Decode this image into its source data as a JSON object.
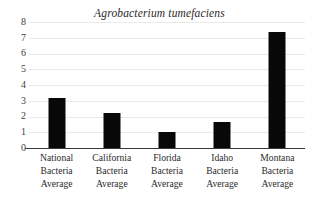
{
  "chart_data": {
    "type": "bar",
    "title": "Agrobacterium tumefaciens",
    "xlabel": "",
    "ylabel": "",
    "ylim": [
      0,
      8
    ],
    "yticks": [
      0,
      1,
      2,
      3,
      4,
      5,
      6,
      7,
      8
    ],
    "grid": true,
    "legend": false,
    "bar_color": "#080808",
    "gridline_color": "#e9e9e9",
    "axis_color": "#3a3a3a",
    "categories": [
      "National Bacteria Average",
      "California Bacteria Average",
      "Florida Bacteria Average",
      "Idaho Bacteria Average",
      "Montana Bacteria Average"
    ],
    "category_lines": [
      [
        "National",
        "Bacteria",
        "Average"
      ],
      [
        "California",
        "Bacteria",
        "Average"
      ],
      [
        "Florida",
        "Bacteria",
        "Average"
      ],
      [
        "Idaho",
        "Bacteria",
        "Average"
      ],
      [
        "Montana",
        "Bacteria",
        "Average"
      ]
    ],
    "values": [
      3.17,
      2.22,
      1.0,
      1.65,
      7.37
    ]
  }
}
